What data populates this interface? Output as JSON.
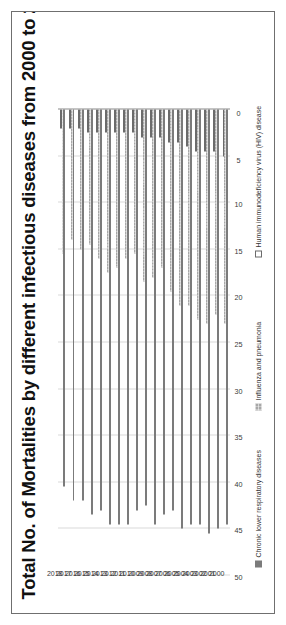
{
  "figure": {
    "title": "Total No. of Mortalities by different infectious diseases from 2000 to 2018",
    "frame_color": "#6f6f6f",
    "background": "#ffffff"
  },
  "chart_data": {
    "type": "bar",
    "orientation": "horizontal",
    "stacked": false,
    "title": "Total No. of Mortalities by different infectious diseases from 2000 to 2018",
    "xlabel": "",
    "ylabel": "",
    "grid": true,
    "legend_position": "bottom",
    "xlim": [
      0,
      50
    ],
    "xticks": [
      0,
      5,
      10,
      15,
      20,
      25,
      30,
      35,
      40,
      45,
      50
    ],
    "tick_labels": [
      "0",
      "5",
      "10",
      "15",
      "20",
      "25",
      "30",
      "35",
      "40",
      "45",
      "50"
    ],
    "categories": [
      "2000",
      "2001",
      "2002",
      "2003",
      "2004",
      "2005",
      "2006",
      "2007",
      "2008",
      "2009",
      "2010",
      "2011",
      "2012",
      "2013",
      "2014",
      "2015",
      "2016",
      "2017",
      "2018"
    ],
    "series": [
      {
        "name": "Chronic lower respiratory diseases",
        "color": "#7b7b7b",
        "pattern": "solid",
        "values": [
          44.5,
          45.0,
          45.5,
          44.5,
          44.5,
          45.0,
          43.0,
          43.5,
          44.5,
          42.5,
          43.0,
          44.5,
          44.5,
          44.5,
          43.0,
          43.5,
          42.0,
          42.0,
          40.5
        ]
      },
      {
        "name": "Influenza and pneumonia",
        "color": "#a8a8a8",
        "pattern": "hatched",
        "values": [
          23.0,
          22.0,
          23.0,
          22.5,
          21.0,
          21.0,
          19.5,
          17.0,
          18.0,
          18.5,
          15.5,
          16.0,
          17.0,
          17.5,
          16.0,
          14.5,
          15.0,
          14.0,
          15.5
        ]
      },
      {
        "name": "Human immunodeficiency virus (HIV) disease",
        "color": "#ffffff",
        "pattern": "outline",
        "values": [
          5.0,
          4.5,
          4.5,
          4.5,
          4.0,
          3.5,
          3.5,
          3.0,
          3.0,
          3.0,
          2.5,
          2.5,
          2.5,
          2.5,
          2.5,
          2.5,
          2.0,
          2.0,
          2.0
        ]
      }
    ]
  }
}
